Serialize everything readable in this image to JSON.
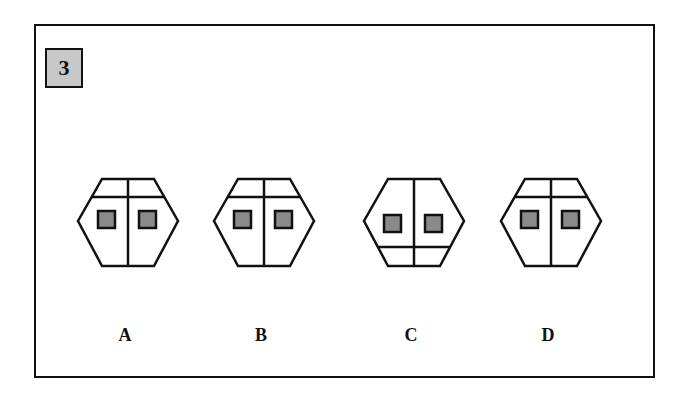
{
  "question": {
    "number": "3",
    "number_box_color": "#c8c8c8"
  },
  "options": [
    {
      "label": "A",
      "cx": 128,
      "divider": "top",
      "note": "horizontal divider near top; two gray squares"
    },
    {
      "label": "B",
      "cx": 264,
      "divider": "top",
      "note": "horizontal divider near top; two gray squares"
    },
    {
      "label": "C",
      "cx": 414,
      "divider": "bottom",
      "note": "horizontal divider near bottom; two gray squares"
    },
    {
      "label": "D",
      "cx": 551,
      "divider": "top",
      "note": "horizontal divider near top; two gray squares"
    }
  ],
  "colors": {
    "stroke": "#111111",
    "square_fill": "#8a8a8a",
    "background": "#ffffff"
  }
}
